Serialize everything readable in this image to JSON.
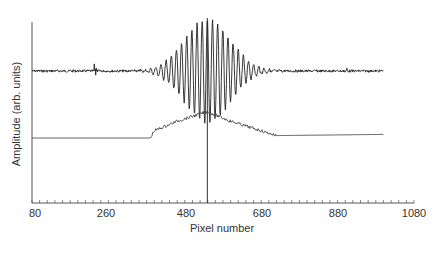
{
  "chart_data": {
    "type": "line",
    "title": "",
    "xlabel": "Pixel number",
    "ylabel": "Amplitude (arb. units)",
    "xlim": [
      80,
      1080
    ],
    "x_ticks": [
      80,
      260,
      480,
      680,
      880,
      1080
    ],
    "x_minor_tick_step": 20,
    "grid": false,
    "legend": null,
    "marker_line_x": 539,
    "series": [
      {
        "name": "interferogram (upper trace)",
        "description": "Noisy baseline with a Gaussian-enveloped oscillating fringe packet centred near pixel 539; envelope spans roughly pixels 360-740, extends from ~80 to ~1000",
        "x_range": [
          80,
          1000
        ],
        "center": 539,
        "peak_amplitude_rel": 1.0,
        "baseline_level_rel": 0.77
      },
      {
        "name": "envelope (lower trace)",
        "description": "Flat baseline rising from ~pixel 390 to a peak near pixel 539, falling back to baseline near pixel 720, flat to ~1000",
        "x_range": [
          80,
          1000
        ],
        "points": [
          [
            80,
            0.0
          ],
          [
            390,
            0.0
          ],
          [
            400,
            0.06
          ],
          [
            460,
            0.14
          ],
          [
            539,
            0.22
          ],
          [
            600,
            0.14
          ],
          [
            680,
            0.06
          ],
          [
            720,
            0.02
          ],
          [
            1000,
            0.03
          ]
        ]
      }
    ]
  },
  "axis": {
    "tick_labels": [
      "80",
      "260",
      "480",
      "680",
      "880",
      "1080"
    ],
    "xlabel": "Pixel number",
    "ylabel": "Amplitude (arb. units)"
  }
}
